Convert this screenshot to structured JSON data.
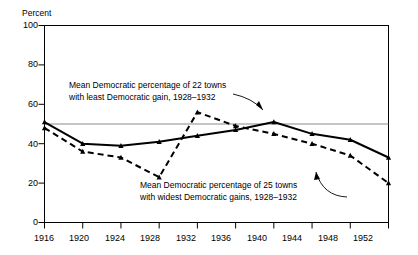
{
  "chart_data": {
    "type": "line",
    "title": "",
    "xlabel": "",
    "ylabel": "Percent",
    "xlim": [
      1916,
      1952
    ],
    "ylim": [
      0,
      100
    ],
    "grid": false,
    "legend_position": "inline-annotations",
    "x": [
      1916,
      1920,
      1924,
      1928,
      1932,
      1936,
      1940,
      1944,
      1948,
      1952
    ],
    "xtick_labels": [
      "1916",
      "1920",
      "1924",
      "1928",
      "1932",
      "1936",
      "1940",
      "1944",
      "1948",
      "1952"
    ],
    "ytick_labels": [
      "0",
      "20",
      "40",
      "60",
      "80",
      "100"
    ],
    "ytick_values": [
      0,
      20,
      40,
      60,
      80,
      100
    ],
    "reference_line": {
      "value": 50,
      "orientation": "horizontal",
      "label": ""
    },
    "series": [
      {
        "name": "Mean Democratic percentage of 22 towns with least Democratic gain, 1928-1932",
        "style": "solid",
        "marker": "filled-triangle",
        "color": "#000000",
        "values": [
          51,
          40,
          39,
          41,
          44,
          47,
          51,
          45,
          42,
          33
        ]
      },
      {
        "name": "Mean Democratic percentage of 25 towns with widest Democratic gains, 1928-1932",
        "style": "dashed",
        "marker": "filled-triangle",
        "color": "#000000",
        "values": [
          48,
          36,
          33,
          23,
          56,
          49,
          45,
          40,
          34,
          20
        ]
      }
    ],
    "annotations": [
      {
        "id": "annotation-least-gain",
        "line1": "Mean Democratic percentage of 22 towns",
        "line2": "with least Democratic gain, 1928–1932",
        "points_to_series": 1
      },
      {
        "id": "annotation-widest-gains",
        "line1": "Mean Democratic percentage of 25 towns",
        "line2": "with widest Democratic gains, 1928–1932",
        "points_to_series": 1
      }
    ]
  },
  "axes": {
    "y_title": "Percent"
  }
}
